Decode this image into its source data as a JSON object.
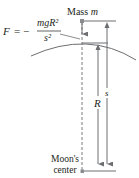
{
  "diagram": {
    "type": "physics-figure",
    "force_equation": {
      "lhs": "F",
      "equals": "= −",
      "numerator": "mgR²",
      "denominator": "s²"
    },
    "mass_label": {
      "prefix": "Mass ",
      "var": "m"
    },
    "radius_label": "R",
    "distance_label": "s",
    "center_label": {
      "line1": "Moon's",
      "line2": "center"
    },
    "colors": {
      "ink": "#231f20",
      "line": "#6d6e71",
      "point": "#8a8c8e"
    }
  }
}
